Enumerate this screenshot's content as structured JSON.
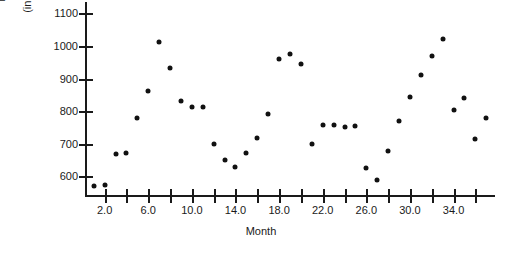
{
  "chart_data": {
    "type": "scatter",
    "title": "",
    "xlabel": "Month",
    "ylabel": "Larcenies (in thousands)",
    "ylabel_line1": "Larcenies",
    "ylabel_line2": "(in thousands)",
    "xlim": [
      0.2,
      37.8
    ],
    "ylim": [
      540,
      1135
    ],
    "grid": false,
    "legend": null,
    "xticks": [
      2.0,
      6.0,
      10.0,
      14.0,
      18.0,
      22.0,
      26.0,
      30.0,
      34.0
    ],
    "xtick_labels": [
      "2.0",
      "6.0",
      "10.0",
      "14.0",
      "18.0",
      "22.0",
      "26.0",
      "30.0",
      "34.0"
    ],
    "xminorticks": [
      4.0,
      8.0,
      12.0,
      16.0,
      20.0,
      24.0,
      28.0,
      32.0,
      36.0
    ],
    "yticks": [
      600,
      700,
      800,
      900,
      1000,
      1100
    ],
    "ytick_labels": [
      "600",
      "700",
      "800",
      "900",
      "1000",
      "1100"
    ],
    "marker": "filled-circle",
    "marker_color": "#111111",
    "x": [
      1,
      2,
      3,
      4,
      5,
      6,
      7,
      8,
      9,
      10,
      11,
      12,
      13,
      14,
      15,
      16,
      17,
      18,
      19,
      20,
      21,
      22,
      23,
      24,
      25,
      26,
      27,
      28,
      29,
      30,
      31,
      32,
      33,
      34,
      35,
      36,
      37
    ],
    "y": [
      572,
      575,
      670,
      672,
      778,
      862,
      1012,
      932,
      830,
      812,
      812,
      700,
      650,
      630,
      672,
      718,
      790,
      960,
      975,
      945,
      700,
      758,
      758,
      752,
      755,
      625,
      588,
      678,
      770,
      845,
      910,
      970,
      1022,
      805,
      842,
      715,
      780
    ],
    "series": [
      {
        "name": "Larcenies",
        "points": [
          [
            1,
            572
          ],
          [
            2,
            575
          ],
          [
            3,
            670
          ],
          [
            4,
            672
          ],
          [
            5,
            778
          ],
          [
            6,
            862
          ],
          [
            7,
            1012
          ],
          [
            8,
            932
          ],
          [
            9,
            830
          ],
          [
            10,
            812
          ],
          [
            11,
            812
          ],
          [
            12,
            700
          ],
          [
            13,
            650
          ],
          [
            14,
            630
          ],
          [
            15,
            672
          ],
          [
            16,
            718
          ],
          [
            17,
            790
          ],
          [
            18,
            960
          ],
          [
            19,
            975
          ],
          [
            20,
            945
          ],
          [
            21,
            700
          ],
          [
            22,
            758
          ],
          [
            23,
            758
          ],
          [
            24,
            752
          ],
          [
            25,
            755
          ],
          [
            26,
            625
          ],
          [
            27,
            588
          ],
          [
            28,
            678
          ],
          [
            29,
            770
          ],
          [
            30,
            845
          ],
          [
            31,
            910
          ],
          [
            32,
            970
          ],
          [
            33,
            1022
          ],
          [
            34,
            805
          ],
          [
            35,
            842
          ],
          [
            36,
            715
          ],
          [
            37,
            780
          ]
        ]
      }
    ]
  },
  "figure": {
    "title_clipped": "",
    "background": "#ffffff",
    "axis_color": "#1a1a1a"
  }
}
